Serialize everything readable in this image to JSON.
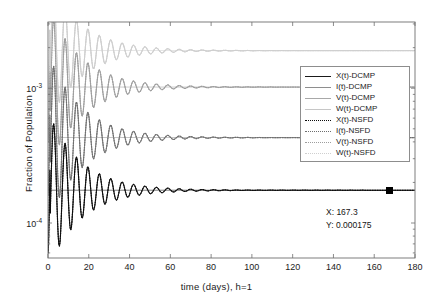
{
  "figure": {
    "title": "",
    "background": "#ffffff",
    "width": 433,
    "height": 301
  },
  "axes": {
    "xlabel": "time (days), h=1",
    "ylabel": "Fraction of Population",
    "xticks": [
      "0",
      "20",
      "40",
      "60",
      "80",
      "100",
      "120",
      "140",
      "160",
      "180"
    ],
    "xtick_values": [
      0,
      20,
      40,
      60,
      80,
      100,
      120,
      140,
      160,
      180
    ],
    "yticks": [
      "10",
      "10"
    ],
    "ytick_exponents": [
      "-3",
      "-4"
    ],
    "ytick_values": [
      0.001,
      0.0001
    ],
    "xlim": [
      0,
      180
    ],
    "ylim": [
      5.5e-05,
      0.0031
    ],
    "yscale": "log",
    "xscale": "linear",
    "grid": false,
    "box": true,
    "axis_color": "#6f6f6f"
  },
  "legend": {
    "position": "east",
    "border_color": "#8d8d8d",
    "background": "#ffffff",
    "entries": [
      {
        "label": "X(t)-DCMP",
        "style": "solid",
        "color": "#1a1a1a",
        "width": 1.4
      },
      {
        "label": "I(t)-DCMP",
        "style": "solid",
        "color": "#8e8e8e",
        "width": 1.1
      },
      {
        "label": "V(t)-DCMP",
        "style": "solid",
        "color": "#a8a8a8",
        "width": 1.0
      },
      {
        "label": "W(t)-DCMP",
        "style": "solid",
        "color": "#c6c6c6",
        "width": 1.0
      },
      {
        "label": "X(t)-NSFD",
        "style": "dotted",
        "color": "#0d0d0d",
        "width": 1.5
      },
      {
        "label": "I(t)-NSFD",
        "style": "dotted",
        "color": "#6e6e6e",
        "width": 1.1
      },
      {
        "label": "V(t)-NSFD",
        "style": "dotted",
        "color": "#9d9d9d",
        "width": 1.0
      },
      {
        "label": "W(t)-NSFD",
        "style": "dotted",
        "color": "#cfcfcf",
        "width": 1.0
      }
    ]
  },
  "data_cursor": {
    "x_label": "X: 167.3",
    "y_label": "Y: 0.000175",
    "x_value": 167.3,
    "y_value": 0.000175,
    "marker": "square",
    "marker_color": "#000000"
  },
  "chart_data": {
    "type": "line",
    "title": "",
    "xlabel": "time (days), h=1",
    "ylabel": "Fraction of Population",
    "xlim": [
      0,
      180
    ],
    "ylim": [
      5.5e-05,
      0.0031
    ],
    "yscale": "log",
    "grid": false,
    "legend_position": "east",
    "x_start": 0,
    "x_end": 180,
    "x_step": 1,
    "note": "Eight damped-oscillation trajectories of a virus-dynamics model; DCMP (solid) and NSFD (dotted) schemes overlay nearly exactly. Each series is described by an analytic damped-cosine approach to its equilibrium.",
    "series": [
      {
        "name": "X(t)-DCMP",
        "style": "solid",
        "color": "#1a1a1a",
        "equilibrium": 0.000175,
        "initial_value": 6e-05,
        "amplitude_ratio": 1.35,
        "damping_rate": 0.062,
        "period_days": 5.6,
        "phase": 3.14159
      },
      {
        "name": "I(t)-DCMP",
        "style": "solid",
        "color": "#8e8e8e",
        "equilibrium": 0.00043,
        "initial_value": 0.00016,
        "amplitude_ratio": 1.45,
        "damping_rate": 0.062,
        "period_days": 5.6,
        "phase": 3.14159
      },
      {
        "name": "V(t)-DCMP",
        "style": "solid",
        "color": "#a8a8a8",
        "equilibrium": 0.00102,
        "initial_value": 0.0004,
        "amplitude_ratio": 1.4,
        "damping_rate": 0.062,
        "period_days": 5.6,
        "phase": 3.14159
      },
      {
        "name": "W(t)-DCMP",
        "style": "solid",
        "color": "#c6c6c6",
        "equilibrium": 0.0019,
        "initial_value": 0.00085,
        "amplitude_ratio": 1.25,
        "damping_rate": 0.062,
        "period_days": 5.6,
        "phase": 3.14159
      },
      {
        "name": "X(t)-NSFD",
        "style": "dotted",
        "color": "#0d0d0d",
        "equilibrium": 0.000175,
        "initial_value": 6e-05,
        "amplitude_ratio": 1.35,
        "damping_rate": 0.062,
        "period_days": 5.6,
        "phase": 3.14159
      },
      {
        "name": "I(t)-NSFD",
        "style": "dotted",
        "color": "#6e6e6e",
        "equilibrium": 0.00043,
        "initial_value": 0.00016,
        "amplitude_ratio": 1.45,
        "damping_rate": 0.062,
        "period_days": 5.6,
        "phase": 3.14159
      },
      {
        "name": "V(t)-NSFD",
        "style": "dotted",
        "color": "#9d9d9d",
        "equilibrium": 0.00102,
        "initial_value": 0.0004,
        "amplitude_ratio": 1.4,
        "damping_rate": 0.062,
        "period_days": 5.6,
        "phase": 3.14159
      },
      {
        "name": "W(t)-NSFD",
        "style": "dotted",
        "color": "#cfcfcf",
        "equilibrium": 0.0019,
        "initial_value": 0.00085,
        "amplitude_ratio": 1.25,
        "damping_rate": 0.062,
        "period_days": 5.6,
        "phase": 3.14159
      }
    ],
    "annotations": [
      {
        "text": "X: 167.3",
        "x": 167.3,
        "y": 0.000175
      },
      {
        "text": "Y: 0.000175",
        "x": 167.3,
        "y": 0.000175
      }
    ]
  }
}
